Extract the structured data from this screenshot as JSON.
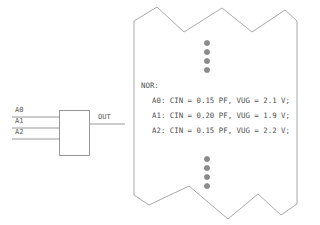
{
  "diagram": {
    "gate": {
      "type_label": "NOR",
      "inputs": [
        {
          "name": "A0",
          "label": "A0"
        },
        {
          "name": "A1",
          "label": "A1"
        },
        {
          "name": "A2",
          "label": "A2"
        }
      ],
      "output": {
        "name": "OUT",
        "label": "OUT"
      }
    },
    "note": {
      "shape": "torn-paper",
      "heading": "NOR:",
      "ellipsis_top_count": 4,
      "ellipsis_bottom_count": 4,
      "lines": [
        "A0: CIN = 0.15 PF, VUG = 2.1 V;",
        "A1: CIN = 0.20 PF, VUG = 1.9 V;",
        "A2: CIN = 0.15 PF, VUG = 2.2 V;"
      ],
      "entries": [
        {
          "pin": "A0",
          "cin": "0.15",
          "cin_unit": "PF",
          "vug": "2.1",
          "vug_unit": "V"
        },
        {
          "pin": "A1",
          "cin": "0.20",
          "cin_unit": "PF",
          "vug": "1.9",
          "vug_unit": "V"
        },
        {
          "pin": "A2",
          "cin": "0.15",
          "cin_unit": "PF",
          "vug": "2.2",
          "vug_unit": "V"
        }
      ]
    },
    "colors": {
      "background": "#ffffff",
      "stroke": "#8d8d8d",
      "paper_stroke": "#9a9a9a",
      "text": "#4f4f4f",
      "dot": "#8c8c8c"
    }
  }
}
